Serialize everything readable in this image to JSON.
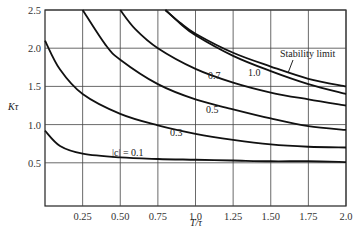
{
  "chart_data": {
    "type": "line",
    "title": "",
    "xlabel": "T/τ",
    "ylabel": "Kτ",
    "xlim": [
      0,
      2.0
    ],
    "ylim": [
      0,
      2.5
    ],
    "grid": true,
    "x_ticks": [
      "0.25",
      "0.50",
      "0.75",
      "1.0",
      "1.25",
      "1.50",
      "1.75",
      "2.0"
    ],
    "y_ticks": [
      "0.5",
      "1.0",
      "1.5",
      "2.0",
      "2.5"
    ],
    "series": [
      {
        "name": "|c| = 0.1",
        "label": "|c| = 0.1",
        "x": [
          0,
          0.1,
          0.25,
          0.5,
          0.75,
          1.0,
          1.25,
          1.5,
          1.75,
          2.0
        ],
        "values": [
          0.92,
          0.72,
          0.62,
          0.57,
          0.55,
          0.54,
          0.53,
          0.52,
          0.52,
          0.51
        ]
      },
      {
        "name": "0.3",
        "label": "0.3",
        "x": [
          0,
          0.1,
          0.25,
          0.5,
          0.75,
          1.0,
          1.25,
          1.5,
          1.75,
          2.0
        ],
        "values": [
          2.1,
          1.72,
          1.4,
          1.14,
          0.99,
          0.88,
          0.8,
          0.74,
          0.71,
          0.7
        ]
      },
      {
        "name": "0.5",
        "label": "0.5",
        "x": [
          0.25,
          0.4,
          0.5,
          0.75,
          1.0,
          1.25,
          1.5,
          1.75,
          2.0
        ],
        "values": [
          2.5,
          2.05,
          1.85,
          1.53,
          1.33,
          1.2,
          1.08,
          0.98,
          0.93
        ]
      },
      {
        "name": "0.7",
        "label": "0.7",
        "x": [
          0.5,
          0.6,
          0.75,
          1.0,
          1.25,
          1.5,
          1.75,
          2.0
        ],
        "values": [
          2.5,
          2.25,
          2.0,
          1.73,
          1.55,
          1.42,
          1.33,
          1.25
        ]
      },
      {
        "name": "1.0",
        "label": "1.0",
        "x": [
          0.8,
          0.9,
          1.0,
          1.25,
          1.5,
          1.75,
          2.0
        ],
        "values": [
          2.5,
          2.32,
          2.17,
          1.9,
          1.7,
          1.53,
          1.4
        ]
      },
      {
        "name": "Stability limit",
        "label": "Stability limit",
        "x": [
          0.8,
          0.9,
          1.0,
          1.25,
          1.5,
          1.75,
          2.0
        ],
        "values": [
          2.5,
          2.33,
          2.19,
          1.94,
          1.76,
          1.6,
          1.5
        ]
      }
    ],
    "annotations": [
      "Stability limit",
      "1.0",
      "0.7",
      "0.5",
      "0.3",
      "|c| = 0.1"
    ]
  }
}
